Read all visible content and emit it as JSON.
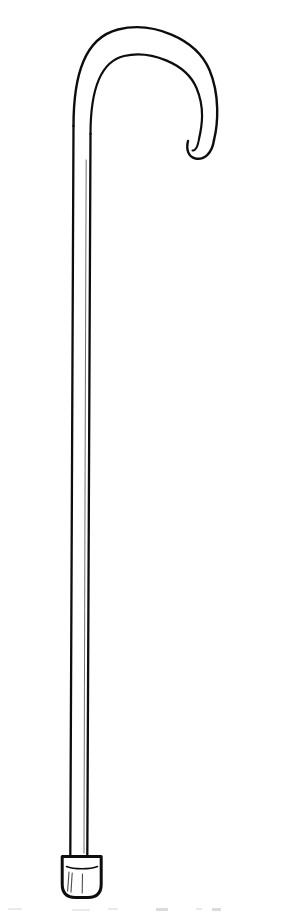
{
  "image": {
    "title": "Walking cane line drawing",
    "subject": "walking-cane",
    "style": "black-and-white line art",
    "width": 283,
    "height": 914,
    "background_color": "#ffffff",
    "ink_color": "#0d0d0d"
  },
  "parts": {
    "handle": {
      "name": "crook handle",
      "label": "Crook handle",
      "description": "Rounded shepherd's crook curving over and down to a blunt rounded tip on the right"
    },
    "shaft": {
      "name": "shaft",
      "label": "Shaft",
      "description": "Long nearly vertical tapering shaft running the full height of the drawing"
    },
    "ferrule": {
      "name": "ferrule",
      "label": "Ferrule tip",
      "description": "Flared trapezoidal rubber tip cap at the bottom with rounded lower corners and vertical shading lines"
    }
  },
  "geometry": {
    "handle_outer_path": "M 73.5 126 C 73.5 74 85 38 118 29.5 C 152 21 196 38 209.5 70 C 220 95 218 124 214 140",
    "handle_inner_path": "M 90.5 134 C 90.5 92 99 62 124 56 C 150 50 186 63 196.5 88 C 205 108 202 126 199 139",
    "handle_tip_path": "M 214 140 C 212 154 204 160 195.5 158.5 C 188 157 186 149 188 141",
    "handle_inner_tip_path": "M 199 139 C 197.5 148 195 151 192.5 150.5",
    "shaft_left_path": "M 73.5 126 C 72.6 300 71.4 520 70.3 858",
    "shaft_right_path": "M 90.5 134 C 89.6 300 88.4 520 87.3 857",
    "shaft_highlight_path": "M 86.2 160 C 85.6 320 84.8 540 84.0 853",
    "ferrule_outline_path": "M 62.2 856.5 L 101.2 856.5 L 101.2 884 Q 101.2 897.5 88.0 897.5 L 75.4 897.5 Q 62.2 897.5 62.2 884 Z",
    "ferrule_collar_path": "M 66.5 866.5 C 74 869.5 90 869.5 97.5 866.5",
    "ferrule_shade_lines": [
      "M 69.0 872 L 67.6 891",
      "M 72.2 873 L 71.0 892",
      "M 82.5 874 L 82.2 893"
    ]
  },
  "caption": {
    "bottom_artifact_text": ""
  }
}
